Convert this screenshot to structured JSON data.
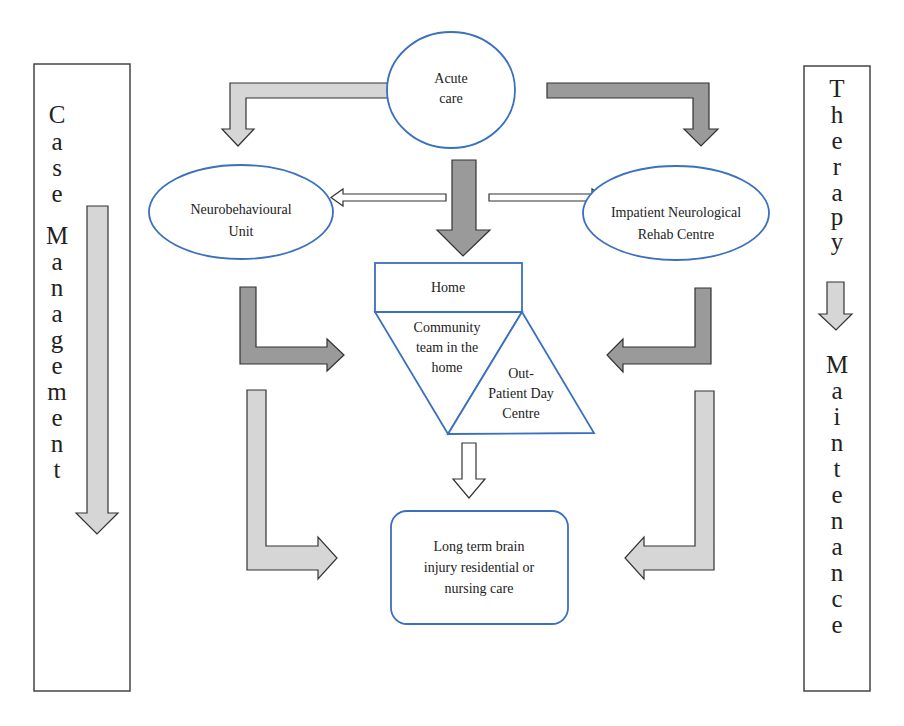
{
  "colors": {
    "node_stroke": "#3b6fbf",
    "box_stroke": "#444444",
    "arrow_light": "#d6d6d6",
    "arrow_dark": "#9a9a9a",
    "arrow_outline": "#333333",
    "text": "#222222",
    "background": "#ffffff"
  },
  "side_panels": {
    "left": {
      "label": "Case Management",
      "letters": [
        "C",
        "a",
        "s",
        "e",
        "M",
        "a",
        "n",
        "a",
        "g",
        "e",
        "m",
        "e",
        "n",
        "t"
      ]
    },
    "right": {
      "label": "Therapy Maintenance",
      "letters_top": [
        "T",
        "h",
        "e",
        "r",
        "a",
        "p",
        "y"
      ],
      "letters_bottom": [
        "M",
        "a",
        "i",
        "n",
        "t",
        "e",
        "n",
        "a",
        "n",
        "c",
        "e"
      ]
    }
  },
  "nodes": {
    "acute_care": {
      "lines": [
        "Acute",
        "care"
      ]
    },
    "neurobehavioural_unit": {
      "lines": [
        "Neurobehavioural",
        "Unit"
      ]
    },
    "impatient_rehab": {
      "lines": [
        "Impatient Neurological",
        "Rehab Centre"
      ]
    },
    "home": {
      "lines": [
        "Home"
      ]
    },
    "community_team": {
      "lines": [
        "Community",
        "team in the",
        "home"
      ]
    },
    "outpatient_day": {
      "lines": [
        "Out-",
        "Patient Day",
        "Centre"
      ]
    },
    "long_term_care": {
      "lines": [
        "Long term brain",
        "injury residential or",
        "nursing care"
      ]
    }
  },
  "edges": [
    {
      "from": "Acute care",
      "to": "Neurobehavioural Unit",
      "style": "light-bent"
    },
    {
      "from": "Acute care",
      "to": "Impatient Neurological Rehab Centre",
      "style": "dark-bent"
    },
    {
      "from": "Acute care",
      "to": "Home",
      "style": "dark-straight"
    },
    {
      "from": "Home",
      "to": "Neurobehavioural Unit",
      "style": "outline-thin"
    },
    {
      "from": "Home",
      "to": "Impatient Neurological Rehab Centre",
      "style": "outline-thin"
    },
    {
      "from": "Neurobehavioural Unit",
      "to": "Community team in the home",
      "style": "dark-bent"
    },
    {
      "from": "Impatient Neurological Rehab Centre",
      "to": "Out-Patient Day Centre",
      "style": "dark-bent"
    },
    {
      "from": "Out-Patient Day Centre",
      "to": "Long term brain injury residential or nursing care",
      "style": "outline"
    },
    {
      "from": "Neurobehavioural Unit",
      "to": "Long term brain injury residential or nursing care",
      "style": "light-bent"
    },
    {
      "from": "Impatient Neurological Rehab Centre",
      "to": "Long term brain injury residential or nursing care",
      "style": "light-bent"
    }
  ]
}
